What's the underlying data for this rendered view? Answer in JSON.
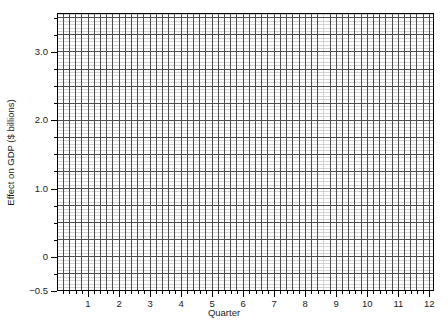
{
  "chart_data": {
    "type": "line",
    "title": "",
    "xlabel": "Quarter",
    "ylabel": "Effect on GDP ($ billions)",
    "xlim": [
      0.0,
      12.15
    ],
    "ylim": [
      -0.5,
      3.57
    ],
    "grid": true,
    "legend": null,
    "series": [],
    "note": "Blank graph-paper style axes; no data series are plotted.",
    "x_ticks": [
      {
        "value": 1,
        "label": "1"
      },
      {
        "value": 2,
        "label": "2"
      },
      {
        "value": 3,
        "label": "3"
      },
      {
        "value": 4,
        "label": "4"
      },
      {
        "value": 5,
        "label": "5"
      },
      {
        "value": 6,
        "label": "6"
      },
      {
        "value": 7,
        "label": "7"
      },
      {
        "value": 8,
        "label": "8"
      },
      {
        "value": 9,
        "label": "9"
      },
      {
        "value": 10,
        "label": "10"
      },
      {
        "value": 11,
        "label": "11"
      },
      {
        "value": 12,
        "label": "12"
      }
    ],
    "y_ticks": [
      {
        "value": 3.0,
        "label": "3.0"
      },
      {
        "value": 2.0,
        "label": "2.0"
      },
      {
        "value": 1.0,
        "label": "1.0"
      },
      {
        "value": 0.0,
        "label": "0"
      },
      {
        "value": -0.5,
        "label": "−0.5"
      }
    ],
    "x_minor_step": 0.2,
    "y_minor_step": 0.05,
    "x_major_step": 0.2,
    "y_major_step": 0.25,
    "colors": {
      "axis": "#000000",
      "major_grid": "#4d4d4d",
      "minor_grid": "#c8c8c8",
      "text": "#1a1a1a",
      "background": "#ffffff"
    }
  }
}
